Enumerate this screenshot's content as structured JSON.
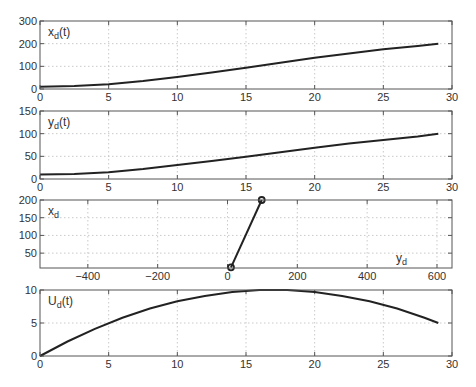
{
  "chart_data": [
    {
      "type": "line",
      "title": "",
      "annotation": {
        "base": "x",
        "sub": "d",
        "suffix": "(t)"
      },
      "xlabel": "",
      "ylabel": "",
      "xlim": [
        0,
        30
      ],
      "ylim": [
        0,
        300
      ],
      "xticks": [
        0,
        5,
        10,
        15,
        20,
        25,
        30
      ],
      "yticks": [
        0,
        100,
        200,
        300
      ],
      "grid": true,
      "series": [
        {
          "name": "x_d(t)",
          "x": [
            0,
            2.5,
            5,
            7.5,
            10,
            12.5,
            15,
            17.5,
            20,
            22.5,
            25,
            27.5,
            29
          ],
          "values": [
            10,
            13,
            21,
            35,
            53,
            73,
            94,
            116,
            138,
            157,
            175,
            190,
            200
          ]
        }
      ]
    },
    {
      "type": "line",
      "title": "",
      "annotation": {
        "base": "y",
        "sub": "d",
        "suffix": "(t)"
      },
      "xlabel": "",
      "ylabel": "",
      "xlim": [
        0,
        30
      ],
      "ylim": [
        0,
        150
      ],
      "xticks": [
        0,
        5,
        10,
        15,
        20,
        25,
        30
      ],
      "yticks": [
        0,
        50,
        100,
        150
      ],
      "grid": true,
      "series": [
        {
          "name": "y_d(t)",
          "x": [
            0,
            2.5,
            5,
            7.5,
            10,
            12.5,
            15,
            17.5,
            20,
            22.5,
            25,
            27.5,
            29
          ],
          "values": [
            10,
            11,
            15,
            22,
            31,
            40,
            49,
            59,
            69,
            78,
            86,
            94,
            100
          ]
        }
      ]
    },
    {
      "type": "line",
      "title": "",
      "annotation": {
        "base": "x",
        "sub": "d",
        "suffix": ""
      },
      "xannotation": {
        "base": "y",
        "sub": "d",
        "suffix": ""
      },
      "xlabel": "",
      "ylabel": "",
      "xlim": [
        -537,
        643
      ],
      "ylim": [
        8,
        200
      ],
      "xticks": [
        -400,
        -200,
        0,
        200,
        400,
        600
      ],
      "yticks": [
        50,
        100,
        150,
        200
      ],
      "grid": true,
      "markers": "circle",
      "series": [
        {
          "name": "x_d vs y_d",
          "x": [
            10,
            98
          ],
          "values": [
            10,
            200
          ]
        }
      ]
    },
    {
      "type": "line",
      "title": "",
      "annotation": {
        "base": "U",
        "sub": "d",
        "suffix": "(t)"
      },
      "xlabel": "",
      "ylabel": "",
      "xlim": [
        0,
        30
      ],
      "ylim": [
        0,
        10
      ],
      "xticks": [
        0,
        5,
        10,
        15,
        20,
        25,
        30
      ],
      "yticks": [
        0,
        5,
        10
      ],
      "grid": true,
      "series": [
        {
          "name": "U_d(t)",
          "x": [
            0,
            2,
            4,
            6,
            8,
            10,
            12,
            14,
            16,
            17,
            18,
            20,
            22,
            24,
            26,
            28,
            29
          ],
          "values": [
            0,
            2.2,
            4.1,
            5.8,
            7.2,
            8.3,
            9.1,
            9.7,
            10.0,
            10.0,
            10.0,
            9.7,
            9.1,
            8.3,
            7.2,
            5.8,
            5.0
          ]
        }
      ]
    }
  ],
  "layout": {
    "panels": [
      {
        "left": 40,
        "right": 452,
        "top": 21,
        "bottom": 89
      },
      {
        "left": 40,
        "right": 452,
        "top": 111,
        "bottom": 179
      },
      {
        "left": 40,
        "right": 452,
        "top": 200,
        "bottom": 268
      },
      {
        "left": 40,
        "right": 452,
        "top": 290,
        "bottom": 356
      }
    ]
  }
}
